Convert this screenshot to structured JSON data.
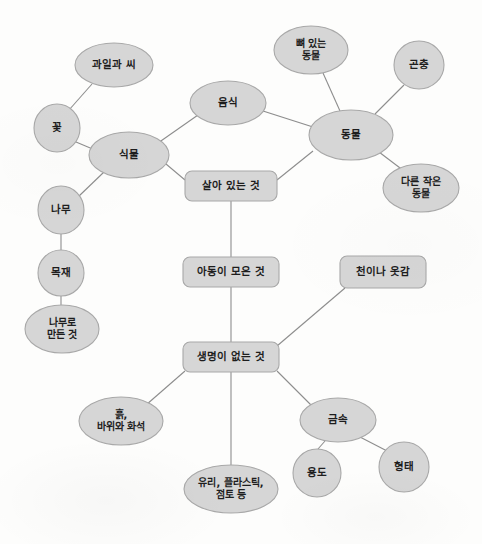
{
  "diagram": {
    "type": "concept-map",
    "language": "ko",
    "background_color": "#fdfdfc",
    "node_fill_color": "#d6d6d6",
    "node_stroke_color": "#a8a8a8",
    "edge_color": "#8d8d8d",
    "label_color": "#1d1d1d",
    "nodes": [
      {
        "id": "fruit_seed",
        "label": "과일과 씨",
        "lines": [
          "과일과 씨"
        ],
        "shape": "ellipse",
        "cx": 114,
        "cy": 65,
        "rx": 39,
        "ry": 22
      },
      {
        "id": "flower",
        "label": "꽃",
        "lines": [
          "꽃"
        ],
        "shape": "ellipse",
        "cx": 57,
        "cy": 128,
        "rx": 23,
        "ry": 24
      },
      {
        "id": "plant",
        "label": "식물",
        "lines": [
          "식물"
        ],
        "shape": "ellipse",
        "cx": 129,
        "cy": 155,
        "rx": 40,
        "ry": 23
      },
      {
        "id": "tree",
        "label": "나무",
        "lines": [
          "나무"
        ],
        "shape": "ellipse",
        "cx": 61,
        "cy": 210,
        "rx": 23,
        "ry": 24
      },
      {
        "id": "timber",
        "label": "목재",
        "lines": [
          "목재"
        ],
        "shape": "ellipse",
        "cx": 61,
        "cy": 273,
        "rx": 23,
        "ry": 23
      },
      {
        "id": "wood_made",
        "label": "나무로 만든 것",
        "lines": [
          "나무로",
          "만든 것"
        ],
        "shape": "ellipse",
        "cx": 62,
        "cy": 329,
        "rx": 37,
        "ry": 24
      },
      {
        "id": "food",
        "label": "음식",
        "lines": [
          "음식"
        ],
        "shape": "ellipse",
        "cx": 228,
        "cy": 103,
        "rx": 38,
        "ry": 22
      },
      {
        "id": "boned_animal",
        "label": "뼈 있는 동물",
        "lines": [
          "뼈 있는",
          "동물"
        ],
        "shape": "ellipse",
        "cx": 311,
        "cy": 50,
        "rx": 37,
        "ry": 24
      },
      {
        "id": "insect",
        "label": "곤충",
        "lines": [
          "곤충"
        ],
        "shape": "ellipse",
        "cx": 419,
        "cy": 65,
        "rx": 25,
        "ry": 24
      },
      {
        "id": "animal",
        "label": "동물",
        "lines": [
          "동물"
        ],
        "shape": "ellipse",
        "cx": 351,
        "cy": 135,
        "rx": 42,
        "ry": 25
      },
      {
        "id": "other_small",
        "label": "다른 작은 동물",
        "lines": [
          "다른 작은",
          "동물"
        ],
        "shape": "ellipse",
        "cx": 421,
        "cy": 188,
        "rx": 38,
        "ry": 24
      },
      {
        "id": "living",
        "label": "살아 있는 것",
        "lines": [
          "살아 있는 것"
        ],
        "shape": "rect",
        "cx": 231,
        "cy": 186,
        "rx": 46,
        "ry": 15
      },
      {
        "id": "child_collect",
        "label": "아동이 모은 것",
        "lines": [
          "아동이 모은 것"
        ],
        "shape": "rect",
        "cx": 231,
        "cy": 272,
        "rx": 48,
        "ry": 15
      },
      {
        "id": "nonliving",
        "label": "생명이 없는 것",
        "lines": [
          "생명이 없는 것"
        ],
        "shape": "rect",
        "cx": 231,
        "cy": 357,
        "rx": 48,
        "ry": 15
      },
      {
        "id": "cloth",
        "label": "천이나 옷감",
        "lines": [
          "천이나 옷감"
        ],
        "shape": "rect",
        "cx": 383,
        "cy": 272,
        "rx": 43,
        "ry": 16
      },
      {
        "id": "soil_rock",
        "label": "흙, 바위와 화석",
        "lines": [
          "흙,",
          "바위와 화석"
        ],
        "shape": "ellipse",
        "cx": 121,
        "cy": 421,
        "rx": 42,
        "ry": 24
      },
      {
        "id": "glass_clay",
        "label": "유리, 플라스틱, 점토 등",
        "lines": [
          "유리, 플라스틱,",
          "점토 등"
        ],
        "shape": "ellipse",
        "cx": 231,
        "cy": 489,
        "rx": 47,
        "ry": 24
      },
      {
        "id": "metal",
        "label": "금속",
        "lines": [
          "금속"
        ],
        "shape": "ellipse",
        "cx": 338,
        "cy": 420,
        "rx": 38,
        "ry": 22
      },
      {
        "id": "usage",
        "label": "용도",
        "lines": [
          "용도"
        ],
        "shape": "ellipse",
        "cx": 317,
        "cy": 473,
        "rx": 24,
        "ry": 24
      },
      {
        "id": "form",
        "label": "형태",
        "lines": [
          "형태"
        ],
        "shape": "ellipse",
        "cx": 404,
        "cy": 467,
        "rx": 25,
        "ry": 25
      }
    ],
    "edges": [
      {
        "from": "fruit_seed",
        "to": "flower",
        "x1": 92,
        "y1": 84,
        "x2": 69,
        "y2": 110
      },
      {
        "from": "flower",
        "to": "plant",
        "x1": 76,
        "y1": 142,
        "x2": 95,
        "y2": 150
      },
      {
        "from": "plant",
        "to": "tree",
        "x1": 104,
        "y1": 172,
        "x2": 78,
        "y2": 197
      },
      {
        "from": "tree",
        "to": "timber",
        "x1": 61,
        "y1": 234,
        "x2": 61,
        "y2": 250
      },
      {
        "from": "timber",
        "to": "wood_made",
        "x1": 61,
        "y1": 296,
        "x2": 61,
        "y2": 305
      },
      {
        "from": "plant",
        "to": "food",
        "x1": 158,
        "y1": 143,
        "x2": 198,
        "y2": 115
      },
      {
        "from": "plant",
        "to": "living",
        "x1": 166,
        "y1": 164,
        "x2": 185,
        "y2": 180
      },
      {
        "from": "food",
        "to": "animal",
        "x1": 263,
        "y1": 111,
        "x2": 313,
        "y2": 127
      },
      {
        "from": "boned_animal",
        "to": "animal",
        "x1": 323,
        "y1": 73,
        "x2": 340,
        "y2": 111
      },
      {
        "from": "insect",
        "to": "animal",
        "x1": 404,
        "y1": 85,
        "x2": 375,
        "y2": 114
      },
      {
        "from": "animal",
        "to": "other_small",
        "x1": 379,
        "y1": 152,
        "x2": 404,
        "y2": 171
      },
      {
        "from": "animal",
        "to": "living",
        "x1": 313,
        "y1": 151,
        "x2": 277,
        "y2": 180
      },
      {
        "from": "living",
        "to": "child_collect",
        "x1": 231,
        "y1": 201,
        "x2": 231,
        "y2": 257
      },
      {
        "from": "child_collect",
        "to": "nonliving",
        "x1": 231,
        "y1": 287,
        "x2": 231,
        "y2": 342
      },
      {
        "from": "cloth",
        "to": "nonliving",
        "x1": 345,
        "y1": 288,
        "x2": 277,
        "y2": 346
      },
      {
        "from": "nonliving",
        "to": "soil_rock",
        "x1": 185,
        "y1": 371,
        "x2": 146,
        "y2": 405
      },
      {
        "from": "nonliving",
        "to": "glass_clay",
        "x1": 231,
        "y1": 372,
        "x2": 231,
        "y2": 465
      },
      {
        "from": "nonliving",
        "to": "metal",
        "x1": 277,
        "y1": 371,
        "x2": 312,
        "y2": 406
      },
      {
        "from": "metal",
        "to": "usage",
        "x1": 325,
        "y1": 441,
        "x2": 318,
        "y2": 449
      },
      {
        "from": "metal",
        "to": "form",
        "x1": 360,
        "y1": 437,
        "x2": 389,
        "y2": 452
      }
    ]
  }
}
